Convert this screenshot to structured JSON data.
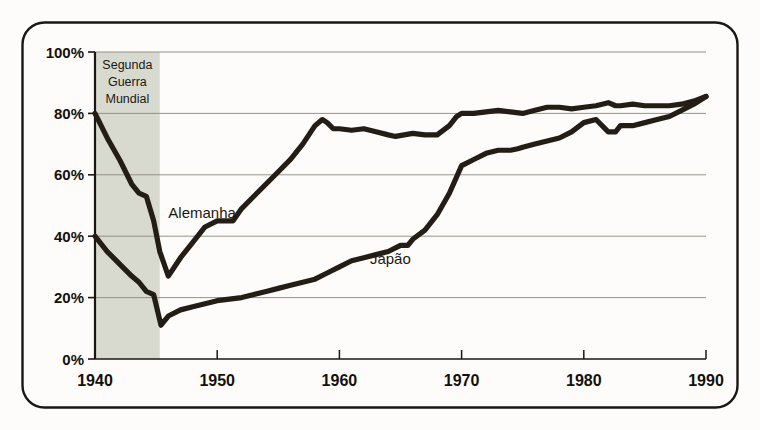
{
  "figure": {
    "background_color": "#fdfcfa",
    "frame_color": "#1a1713",
    "axis_color": "#1a1713",
    "gridline_color": "#8a887f",
    "line_color": "#241d16",
    "shade_color": "#d9dacf"
  },
  "chart_data": {
    "type": "line",
    "title": "",
    "subtitle": "",
    "xlabel": "",
    "ylabel": "",
    "xlim": [
      1940,
      1990
    ],
    "ylim": [
      0,
      100
    ],
    "grid": true,
    "legend_position": "inline-labels",
    "x_ticks": [
      1940,
      1950,
      1960,
      1970,
      1980,
      1990
    ],
    "x_tick_labels": [
      "1940",
      "1950",
      "1960",
      "1970",
      "1980",
      "1990"
    ],
    "y_ticks": [
      0,
      20,
      40,
      60,
      80,
      100
    ],
    "y_tick_labels": [
      "0%",
      "20%",
      "40%",
      "60%",
      "80%",
      "100%"
    ],
    "annotations": [
      {
        "name": "war-band",
        "lines": [
          "Segunda",
          "Guerra",
          "Mundial"
        ],
        "x_start": 1940,
        "x_end": 1945.3
      },
      {
        "name": "series-label-germany",
        "text": "Alemanha",
        "x": 1946.0,
        "y": 46.0
      },
      {
        "name": "series-label-japan",
        "text": "Japão",
        "x": 1962.5,
        "y": 31.0
      }
    ],
    "series": [
      {
        "name": "Alemanha",
        "color": "#241d16",
        "x": [
          1940,
          1941,
          1942,
          1943,
          1943.6,
          1944.2,
          1944.8,
          1945.3,
          1946,
          1947,
          1948,
          1949,
          1950,
          1950.6,
          1951.3,
          1952,
          1953,
          1954,
          1955,
          1956,
          1957,
          1958,
          1958.6,
          1959,
          1959.5,
          1960,
          1961,
          1962,
          1963,
          1964,
          1964.6,
          1965.3,
          1966,
          1967,
          1968,
          1969,
          1969.6,
          1970,
          1971,
          1972,
          1973,
          1974,
          1975,
          1976,
          1977,
          1978,
          1979,
          1980,
          1981,
          1982,
          1982.6,
          1983,
          1984,
          1985,
          1986,
          1987,
          1988,
          1989,
          1990
        ],
        "y": [
          80,
          72,
          65,
          57,
          54,
          53,
          45,
          35,
          27,
          33,
          38,
          43,
          45,
          45,
          45,
          49,
          53,
          57,
          61,
          65,
          70,
          76,
          78,
          77,
          75,
          75,
          74.5,
          75,
          74,
          73,
          72.5,
          73,
          73.5,
          73,
          73,
          76,
          79,
          80,
          80,
          80.5,
          81,
          80.5,
          80,
          81,
          82,
          82,
          81.5,
          82,
          82.5,
          83.5,
          82.5,
          82.5,
          83,
          82.5,
          82.5,
          82.5,
          83,
          84,
          85.5
        ],
        "ylabel_unit": "%"
      },
      {
        "name": "Japão",
        "color": "#241d16",
        "x": [
          1940,
          1941,
          1942,
          1943,
          1943.6,
          1944.2,
          1944.8,
          1945.4,
          1946,
          1947,
          1948,
          1949,
          1950,
          1951,
          1952,
          1953,
          1954,
          1955,
          1956,
          1957,
          1958,
          1959,
          1960,
          1961,
          1962,
          1963,
          1964,
          1965,
          1965.6,
          1966,
          1967,
          1968,
          1969,
          1970,
          1971,
          1972,
          1973,
          1974,
          1974.6,
          1975,
          1976,
          1977,
          1978,
          1979,
          1980,
          1981,
          1982,
          1982.6,
          1983,
          1984,
          1985,
          1986,
          1987,
          1988,
          1989,
          1990
        ],
        "y": [
          40,
          35,
          31,
          27,
          25,
          22,
          21,
          11,
          14,
          16,
          17,
          18,
          19,
          19.5,
          20,
          21,
          22,
          23,
          24,
          25,
          26,
          28,
          30,
          32,
          33,
          34,
          35,
          37,
          37,
          39,
          42,
          47,
          54,
          63,
          65,
          67,
          68,
          68,
          68.5,
          69,
          70,
          71,
          72,
          74,
          77,
          78,
          74,
          74,
          76,
          76,
          77,
          78,
          79,
          81,
          83,
          85.5
        ],
        "ylabel_unit": "%"
      }
    ]
  }
}
